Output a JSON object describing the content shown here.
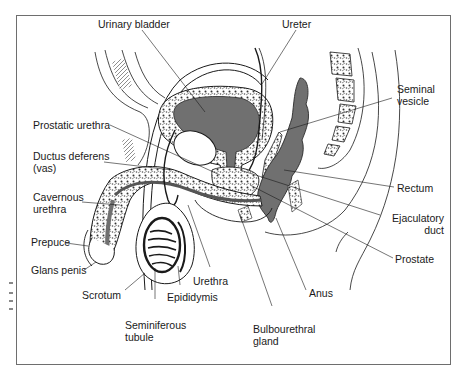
{
  "diagram": {
    "colors": {
      "frame": "#6e6e6e",
      "organ_fill": "#707070",
      "line": "#1a1a1a",
      "background": "#ffffff"
    },
    "labels": {
      "urinary_bladder": "Urinary bladder",
      "ureter": "Ureter",
      "seminal_vesicle_1": "Seminal",
      "seminal_vesicle_2": "vesicle",
      "prostatic_urethra": "Prostatic urethra",
      "ductus_deferens_1": "Ductus deferens",
      "ductus_deferens_2": "(vas)",
      "cavernous_urethra_1": "Cavernous",
      "cavernous_urethra_2": "urethra",
      "prepuce": "Prepuce",
      "glans_penis": "Glans penis",
      "scrotum": "Scrotum",
      "seminiferous_tubule_1": "Seminiferous",
      "seminiferous_tubule_2": "tubule",
      "epididymis": "Epididymis",
      "urethra": "Urethra",
      "bulbourethral_gland_1": "Bulbourethral",
      "bulbourethral_gland_2": "gland",
      "anus": "Anus",
      "rectum": "Rectum",
      "ejaculatory_duct_1": "Ejaculatory",
      "ejaculatory_duct_2": "duct",
      "prostate": "Prostate"
    }
  }
}
